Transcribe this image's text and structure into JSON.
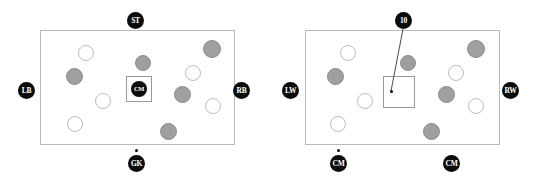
{
  "diagram": {
    "type": "football-pitch-position-pair",
    "panels": [
      {
        "id": "left-panel",
        "pitch": {
          "x": 40,
          "y": 30,
          "width": 195,
          "height": 115
        },
        "focus_box": {
          "x": 126,
          "y": 76,
          "width": 26,
          "height": 26
        },
        "badges": [
          {
            "name": "badge-st",
            "label": "ST",
            "x": 127,
            "y": 12,
            "size": 17,
            "font_size": 7.5
          },
          {
            "name": "badge-lb",
            "label": "LB",
            "x": 18,
            "y": 82,
            "size": 17,
            "font_size": 7.5
          },
          {
            "name": "badge-rb",
            "label": "RB",
            "x": 233,
            "y": 82,
            "size": 17,
            "font_size": 7.5
          },
          {
            "name": "badge-gk",
            "label": "GK",
            "x": 128,
            "y": 155,
            "size": 17,
            "font_size": 7.5
          },
          {
            "name": "badge-cm-center",
            "label": "CM",
            "x": 131,
            "y": 81,
            "size": 16,
            "font_size": 6.5
          }
        ],
        "anchor_dots": [
          {
            "name": "anchor-dot-gk",
            "x": 135,
            "y": 149
          }
        ],
        "leaders": [],
        "players": [
          {
            "name": "player-light-1",
            "tone": "light",
            "x": 78,
            "y": 45,
            "d": 16
          },
          {
            "name": "player-dark-1",
            "tone": "dark",
            "x": 66,
            "y": 68,
            "d": 17
          },
          {
            "name": "player-dark-2",
            "tone": "dark",
            "x": 135,
            "y": 55,
            "d": 16
          },
          {
            "name": "player-dark-3",
            "tone": "dark",
            "x": 203,
            "y": 40,
            "d": 18
          },
          {
            "name": "player-light-2",
            "tone": "light",
            "x": 185,
            "y": 65,
            "d": 16
          },
          {
            "name": "player-light-3",
            "tone": "light",
            "x": 95,
            "y": 93,
            "d": 16
          },
          {
            "name": "player-dark-4",
            "tone": "dark",
            "x": 174,
            "y": 86,
            "d": 17
          },
          {
            "name": "player-light-4",
            "tone": "light",
            "x": 205,
            "y": 98,
            "d": 16
          },
          {
            "name": "player-light-5",
            "tone": "light",
            "x": 67,
            "y": 116,
            "d": 16
          },
          {
            "name": "player-dark-5",
            "tone": "dark",
            "x": 160,
            "y": 123,
            "d": 17
          }
        ]
      },
      {
        "id": "right-panel",
        "pitch": {
          "x": 35,
          "y": 30,
          "width": 195,
          "height": 115
        },
        "focus_box": {
          "x": 113,
          "y": 76,
          "width": 32,
          "height": 32
        },
        "badges": [
          {
            "name": "badge-10",
            "label": "10",
            "x": 125,
            "y": 12,
            "size": 17,
            "font_size": 7.5
          },
          {
            "name": "badge-lw",
            "label": "LW",
            "x": 12,
            "y": 82,
            "size": 17,
            "font_size": 7.5
          },
          {
            "name": "badge-rw",
            "label": "RW",
            "x": 232,
            "y": 82,
            "size": 17,
            "font_size": 7.5
          },
          {
            "name": "badge-cm-left",
            "label": "CM",
            "x": 60,
            "y": 155,
            "size": 17,
            "font_size": 7.5
          },
          {
            "name": "badge-cm-right",
            "label": "CM",
            "x": 173,
            "y": 155,
            "size": 17,
            "font_size": 7.5
          }
        ],
        "anchor_dots": [
          {
            "name": "anchor-dot-ten",
            "x": 120,
            "y": 90
          },
          {
            "name": "anchor-dot-cm-left",
            "x": 67,
            "y": 149
          }
        ],
        "leaders": [
          {
            "name": "leader-ten",
            "x1": 133,
            "y1": 29,
            "x2": 121,
            "y2": 91
          }
        ],
        "players": [
          {
            "name": "player-light-1",
            "tone": "light",
            "x": 70,
            "y": 45,
            "d": 16
          },
          {
            "name": "player-dark-1",
            "tone": "dark",
            "x": 57,
            "y": 68,
            "d": 17
          },
          {
            "name": "player-dark-2",
            "tone": "dark",
            "x": 130,
            "y": 55,
            "d": 16
          },
          {
            "name": "player-dark-3",
            "tone": "dark",
            "x": 197,
            "y": 40,
            "d": 18
          },
          {
            "name": "player-light-2",
            "tone": "light",
            "x": 178,
            "y": 65,
            "d": 16
          },
          {
            "name": "player-light-3",
            "tone": "light",
            "x": 87,
            "y": 93,
            "d": 16
          },
          {
            "name": "player-dark-4",
            "tone": "dark",
            "x": 168,
            "y": 86,
            "d": 17
          },
          {
            "name": "player-light-4",
            "tone": "light",
            "x": 198,
            "y": 98,
            "d": 16
          },
          {
            "name": "player-light-5",
            "tone": "light",
            "x": 60,
            "y": 116,
            "d": 16
          },
          {
            "name": "player-dark-5",
            "tone": "dark",
            "x": 153,
            "y": 123,
            "d": 17
          }
        ]
      }
    ],
    "colors": {
      "badge_fill": "#0b0b0b",
      "badge_text": "#ffffff",
      "player_dark": "#9f9f9f",
      "player_dark_stroke": "#8c8c8c",
      "player_light": "#ffffff",
      "player_light_stroke": "#bdbdbd",
      "pitch_stroke": "#b9b9b9",
      "focus_stroke": "#9a9a9a",
      "leader_stroke": "#4a4a4a",
      "background": "#ffffff"
    }
  }
}
